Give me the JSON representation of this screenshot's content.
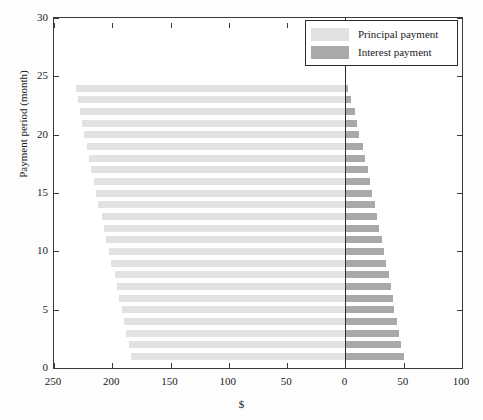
{
  "chart_data": {
    "type": "bar",
    "orientation": "horizontal",
    "subtype": "diverging-amortization",
    "title": "",
    "xlabel": "$",
    "ylabel": "Payment period (month)",
    "xlim": [
      250,
      100
    ],
    "x_axis_reversed": true,
    "xticks": [
      250,
      200,
      150,
      100,
      50,
      0,
      100
    ],
    "xtick_labels": [
      "250",
      "200",
      "150",
      "100",
      "50",
      "0",
      "50",
      "100"
    ],
    "xtick_values": [
      250,
      200,
      150,
      100,
      50,
      0,
      -50,
      -100
    ],
    "ylim": [
      0,
      30
    ],
    "yticks": [
      0,
      5,
      10,
      15,
      20,
      25,
      30
    ],
    "ytick_labels": [
      "0",
      "5",
      "10",
      "15",
      "20",
      "25",
      "30"
    ],
    "grid": false,
    "legend_position": "top-right",
    "categories": [
      1,
      2,
      3,
      4,
      5,
      6,
      7,
      8,
      9,
      10,
      11,
      12,
      13,
      14,
      15,
      16,
      17,
      18,
      19,
      20,
      21,
      22,
      23,
      24
    ],
    "series": [
      {
        "name": "Principal payment",
        "color": "#e2e2e2",
        "direction": "left",
        "values": [
          184,
          186,
          188,
          190,
          192,
          194,
          196,
          198,
          201,
          203,
          205,
          207,
          209,
          212,
          214,
          216,
          218,
          220,
          222,
          224,
          226,
          228,
          229,
          231
        ]
      },
      {
        "name": "Interest payment",
        "color": "#a9a9a9",
        "direction": "right",
        "values": [
          50,
          48,
          46,
          44,
          42,
          41,
          39,
          37,
          35,
          33,
          31,
          29,
          27,
          25,
          23,
          21,
          19,
          17,
          15,
          12,
          10,
          8,
          5,
          2
        ]
      }
    ]
  },
  "legend": {
    "items": [
      {
        "label": "Principal payment",
        "swatch": "principal"
      },
      {
        "label": "Interest payment",
        "swatch": "interest"
      }
    ]
  },
  "axes": {
    "x_title": "$",
    "y_title": "Payment period (month)"
  }
}
